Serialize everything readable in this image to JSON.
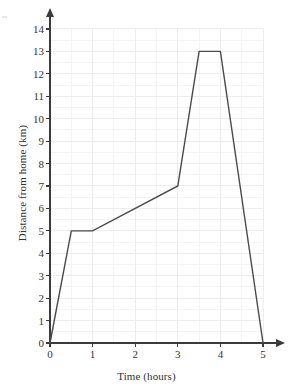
{
  "chart_data": {
    "type": "line",
    "title": "",
    "xlabel": "Time (hours)",
    "ylabel": "Distance from home (km)",
    "xlim": [
      0,
      5
    ],
    "ylim": [
      0,
      14
    ],
    "x_ticks": [
      "0",
      "1",
      "2",
      "3",
      "4",
      "5"
    ],
    "y_ticks": [
      "0",
      "1",
      "2",
      "3",
      "4",
      "5",
      "6",
      "7",
      "8",
      "9",
      "10",
      "11",
      "12",
      "13",
      "14"
    ],
    "grid": true,
    "grid_minor_step": 0.5,
    "legend": null,
    "series": [
      {
        "name": "Distance from home",
        "x": [
          0,
          0.5,
          1,
          3,
          3.5,
          4,
          5
        ],
        "y": [
          0,
          5,
          5,
          7,
          13,
          13,
          0
        ]
      }
    ],
    "line_color": "#4a4a4a",
    "grid_color": "#ededed",
    "axis_color": "#3b3b3b",
    "background_color": "#ffffff"
  },
  "axes": {
    "x_title": "Time (hours)",
    "y_title": "Distance from home (km)"
  }
}
